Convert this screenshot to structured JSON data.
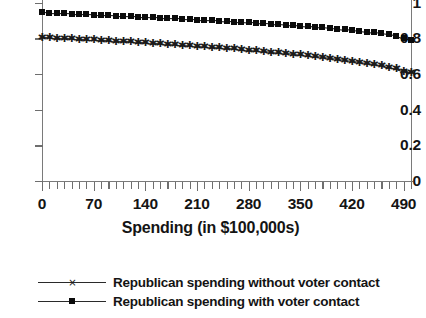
{
  "chart_data": {
    "type": "line",
    "title": "",
    "subtitle": "",
    "xlabel": "Spending (in $100,000s)",
    "ylabel": "",
    "xlim": [
      0,
      500
    ],
    "ylim": [
      0,
      1
    ],
    "grid": false,
    "legend_position": "bottom-left",
    "x_tick_labels": [
      "0",
      "70",
      "140",
      "210",
      "280",
      "350",
      "420",
      "490"
    ],
    "x_tick_values": [
      0,
      70,
      140,
      210,
      280,
      350,
      420,
      490
    ],
    "x_minor_tick_step": 10,
    "y_tick_labels": [
      "0",
      "0.2",
      "0.4",
      "0.6",
      "0.8",
      "1"
    ],
    "y_tick_values": [
      0,
      0.2,
      0.4,
      0.6,
      0.8,
      1
    ],
    "x": [
      0,
      10,
      20,
      30,
      40,
      50,
      60,
      70,
      80,
      90,
      100,
      110,
      120,
      130,
      140,
      150,
      160,
      170,
      180,
      190,
      200,
      210,
      220,
      230,
      240,
      250,
      260,
      270,
      280,
      290,
      300,
      310,
      320,
      330,
      340,
      350,
      360,
      370,
      380,
      390,
      400,
      410,
      420,
      430,
      440,
      450,
      460,
      470,
      480,
      490,
      500
    ],
    "series": [
      {
        "name": "Republican spending with voter contact",
        "marker": "filled-square",
        "color": "#0b0b0b",
        "values": [
          0.945,
          0.943,
          0.941,
          0.94,
          0.938,
          0.936,
          0.934,
          0.932,
          0.931,
          0.929,
          0.927,
          0.925,
          0.923,
          0.921,
          0.919,
          0.917,
          0.915,
          0.913,
          0.911,
          0.909,
          0.907,
          0.905,
          0.903,
          0.901,
          0.899,
          0.896,
          0.894,
          0.892,
          0.889,
          0.887,
          0.884,
          0.882,
          0.879,
          0.876,
          0.873,
          0.87,
          0.867,
          0.864,
          0.861,
          0.857,
          0.854,
          0.85,
          0.846,
          0.842,
          0.838,
          0.833,
          0.828,
          0.822,
          0.814,
          0.801,
          0.79
        ]
      },
      {
        "name": "Republican spending without voter contact",
        "marker": "cross",
        "color": "#1a1a1a",
        "values": [
          0.805,
          0.803,
          0.801,
          0.799,
          0.797,
          0.795,
          0.793,
          0.791,
          0.789,
          0.787,
          0.784,
          0.782,
          0.78,
          0.777,
          0.775,
          0.772,
          0.77,
          0.767,
          0.764,
          0.762,
          0.759,
          0.756,
          0.753,
          0.75,
          0.747,
          0.744,
          0.741,
          0.737,
          0.734,
          0.73,
          0.727,
          0.723,
          0.719,
          0.715,
          0.711,
          0.707,
          0.702,
          0.698,
          0.693,
          0.688,
          0.683,
          0.678,
          0.672,
          0.667,
          0.661,
          0.654,
          0.647,
          0.639,
          0.628,
          0.615,
          0.607
        ]
      }
    ]
  },
  "legend": {
    "items": [
      {
        "label": "Republican spending without voter contact",
        "marker": "cross"
      },
      {
        "label": "Republican spending with voter contact",
        "marker": "filled-square"
      }
    ]
  }
}
